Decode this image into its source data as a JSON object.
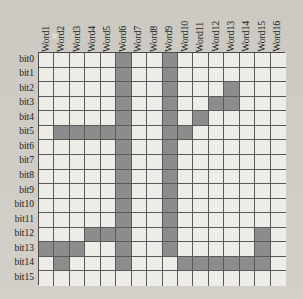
{
  "figure": {
    "title": "",
    "colors": {
      "cell_on": "#8c8c8c",
      "cell_off": "#edece7",
      "grid_line": "#59595a",
      "border": "#4a4a4a",
      "page_background": "#cfcdc6",
      "text": "#1a1a1a"
    }
  },
  "chart_data": {
    "type": "heatmap",
    "title": "",
    "xlabel": "",
    "ylabel": "",
    "legend": [],
    "grid": true,
    "x_categories": [
      "Word1",
      "Word2",
      "Word3",
      "Word4",
      "Word5",
      "Word6",
      "Word7",
      "Word8",
      "Word9",
      "Word10",
      "Word11",
      "Word12",
      "Word13",
      "Word14",
      "Word15",
      "Word16"
    ],
    "y_categories": [
      "bit0",
      "bit1",
      "bit2",
      "bit3",
      "bit4",
      "bit5",
      "bit6",
      "bit7",
      "bit8",
      "bit9",
      "bit10",
      "bit11",
      "bit12",
      "bit13",
      "bit14",
      "bit15"
    ],
    "value_legend": {
      "0": "unshaded cell",
      "1": "shaded cell"
    },
    "values": [
      [
        0,
        0,
        0,
        0,
        0,
        1,
        0,
        0,
        1,
        0,
        0,
        0,
        0,
        0,
        0,
        0
      ],
      [
        0,
        0,
        0,
        0,
        0,
        1,
        0,
        0,
        1,
        0,
        0,
        0,
        0,
        0,
        0,
        0
      ],
      [
        0,
        0,
        0,
        0,
        0,
        1,
        0,
        0,
        1,
        0,
        0,
        0,
        1,
        0,
        0,
        0
      ],
      [
        0,
        0,
        0,
        0,
        0,
        1,
        0,
        0,
        1,
        0,
        0,
        1,
        1,
        0,
        0,
        0
      ],
      [
        0,
        0,
        0,
        0,
        0,
        1,
        0,
        0,
        1,
        0,
        1,
        0,
        0,
        0,
        0,
        0
      ],
      [
        0,
        1,
        1,
        1,
        1,
        1,
        0,
        0,
        1,
        1,
        0,
        0,
        0,
        0,
        0,
        0
      ],
      [
        0,
        0,
        0,
        0,
        0,
        1,
        0,
        0,
        1,
        0,
        0,
        0,
        0,
        0,
        0,
        0
      ],
      [
        0,
        0,
        0,
        0,
        0,
        1,
        0,
        0,
        1,
        0,
        0,
        0,
        0,
        0,
        0,
        0
      ],
      [
        0,
        0,
        0,
        0,
        0,
        1,
        0,
        0,
        1,
        0,
        0,
        0,
        0,
        0,
        0,
        0
      ],
      [
        0,
        0,
        0,
        0,
        0,
        1,
        0,
        0,
        1,
        0,
        0,
        0,
        0,
        0,
        0,
        0
      ],
      [
        0,
        0,
        0,
        0,
        0,
        1,
        0,
        0,
        1,
        0,
        0,
        0,
        0,
        0,
        0,
        0
      ],
      [
        0,
        0,
        0,
        0,
        0,
        1,
        0,
        0,
        1,
        0,
        0,
        0,
        0,
        0,
        0,
        0
      ],
      [
        0,
        0,
        0,
        1,
        1,
        1,
        0,
        0,
        1,
        0,
        0,
        0,
        0,
        0,
        1,
        0
      ],
      [
        1,
        1,
        1,
        0,
        0,
        1,
        0,
        0,
        1,
        0,
        0,
        0,
        0,
        0,
        1,
        0
      ],
      [
        0,
        1,
        0,
        0,
        0,
        1,
        0,
        0,
        0,
        1,
        1,
        1,
        1,
        1,
        1,
        0
      ],
      [
        0,
        0,
        0,
        0,
        0,
        0,
        0,
        0,
        0,
        0,
        0,
        0,
        0,
        0,
        0,
        0
      ]
    ]
  }
}
